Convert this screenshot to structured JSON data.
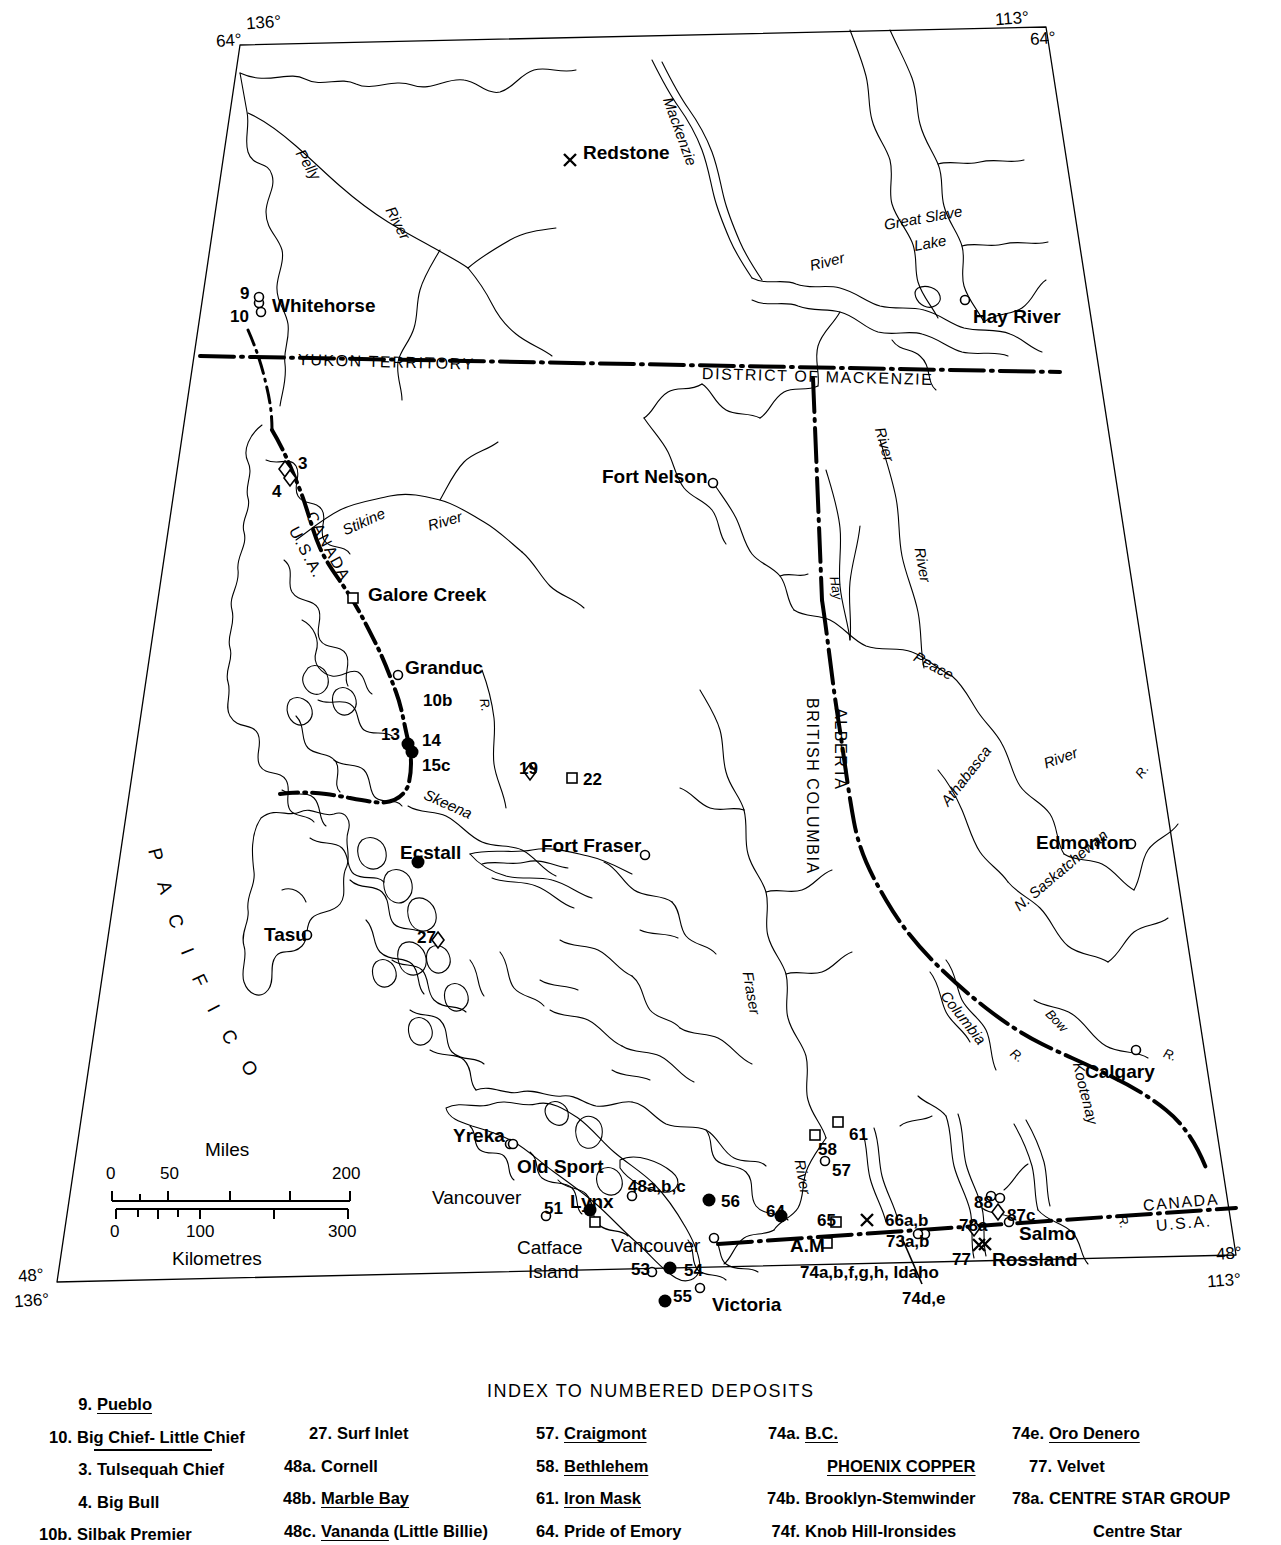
{
  "map": {
    "title": "Map of British Columbia and adjacent regions showing numbered mineral deposits",
    "corner_coords": [
      {
        "name": "top-left-lon",
        "text": "136°"
      },
      {
        "name": "top-left-lat",
        "text": "64°"
      },
      {
        "name": "top-right-lon",
        "text": "113°"
      },
      {
        "name": "top-right-lat",
        "text": "64°"
      },
      {
        "name": "bottom-left-lat",
        "text": "48°"
      },
      {
        "name": "bottom-left-lon",
        "text": "136°"
      },
      {
        "name": "bottom-right-lat",
        "text": "48°"
      },
      {
        "name": "bottom-right-lon",
        "text": "113°"
      }
    ],
    "places": [
      {
        "label": "Redstone",
        "x": 583,
        "y": 143,
        "marker": "x",
        "mx": 570,
        "my": 160
      },
      {
        "label": "Whitehorse",
        "x": 272,
        "y": 296,
        "marker": "circle",
        "mx": 259,
        "my": 303
      },
      {
        "label": "Hay River",
        "x": 973,
        "y": 307,
        "marker": "circle",
        "mx": 965,
        "my": 300
      },
      {
        "label": "Fort Nelson",
        "x": 602,
        "y": 467,
        "marker": "circle",
        "mx": 713,
        "my": 483
      },
      {
        "label": "Galore Creek",
        "x": 368,
        "y": 585,
        "marker": "square",
        "mx": 353,
        "my": 598
      },
      {
        "label": "Granduc",
        "x": 405,
        "y": 658,
        "marker": "circle",
        "mx": 398,
        "my": 675
      },
      {
        "label": "Ecstall",
        "x": 400,
        "y": 843,
        "marker": "dot",
        "mx": 418,
        "my": 862
      },
      {
        "label": "Fort Fraser",
        "x": 541,
        "y": 836,
        "marker": "circle",
        "mx": 645,
        "my": 855
      },
      {
        "label": "Tasu",
        "x": 264,
        "y": 925,
        "marker": "circle",
        "mx": 307,
        "my": 935
      },
      {
        "label": "Edmonton",
        "x": 1036,
        "y": 833,
        "marker": "circle",
        "mx": 1131,
        "my": 844
      },
      {
        "label": "Calgary",
        "x": 1085,
        "y": 1062,
        "marker": "circle",
        "mx": 1136,
        "my": 1050
      },
      {
        "label": "Yreka",
        "x": 453,
        "y": 1126,
        "marker": "circle",
        "mx": 510,
        "my": 1144
      },
      {
        "label": "Old Sport",
        "x": 517,
        "y": 1157,
        "marker": "circle",
        "mx": 513,
        "my": 1144
      },
      {
        "label": "Vancouver",
        "x": 432,
        "y": 1188,
        "marker": "none",
        "mx": 0,
        "my": 0
      },
      {
        "label": "Lynx",
        "x": 570,
        "y": 1192,
        "marker": "dot",
        "mx": 590,
        "my": 1210
      },
      {
        "label": "Catface",
        "x": 517,
        "y": 1238,
        "marker": "none",
        "mx": 0,
        "my": 0
      },
      {
        "label": "Island",
        "x": 528,
        "y": 1262,
        "marker": "none",
        "mx": 0,
        "my": 0
      },
      {
        "label": "Vancouver",
        "x": 611,
        "y": 1236,
        "marker": "circle",
        "mx": 714,
        "my": 1238
      },
      {
        "label": "Victoria",
        "x": 712,
        "y": 1295,
        "marker": "circle",
        "mx": 700,
        "my": 1288
      },
      {
        "label": "Salmo",
        "x": 1019,
        "y": 1224,
        "marker": "circle",
        "mx": 1009,
        "my": 1222
      },
      {
        "label": "Rossland",
        "x": 992,
        "y": 1250,
        "marker": "x",
        "mx": 985,
        "my": 1244
      },
      {
        "label": "A.M",
        "x": 790,
        "y": 1236,
        "marker": "square",
        "mx": 827,
        "my": 1243
      }
    ],
    "ocean_label": "P A C I F I C    O C E A N",
    "regions": [
      {
        "label": "YUKON TERRITORY",
        "x": 298,
        "y": 352
      },
      {
        "label": "DISTRICT OF MACKENZIE",
        "x": 702,
        "y": 366
      },
      {
        "label": "BRITISH COLUMBIA",
        "x": 812,
        "y": 690
      },
      {
        "label": "ALBERTA",
        "x": 840,
        "y": 700
      },
      {
        "label": "CANADA",
        "x": 310,
        "y": 505
      },
      {
        "label": "U.S.A.",
        "x": 293,
        "y": 520
      },
      {
        "label": "CANADA",
        "x": 1143,
        "y": 1198
      },
      {
        "label": "U.S.A.",
        "x": 1156,
        "y": 1218
      }
    ],
    "rivers": [
      {
        "label": "Pelly",
        "x": 300,
        "y": 143,
        "rot": 58
      },
      {
        "label": "River",
        "x": 390,
        "y": 200,
        "rot": 62
      },
      {
        "label": "Mackenzie",
        "x": 668,
        "y": 90,
        "rot": 70
      },
      {
        "label": "River",
        "x": 810,
        "y": 258,
        "rot": -14
      },
      {
        "label": "Great Slave",
        "x": 884,
        "y": 217,
        "rot": -10
      },
      {
        "label": "Lake",
        "x": 914,
        "y": 238,
        "rot": -10
      },
      {
        "label": "River",
        "x": 880,
        "y": 420,
        "rot": 74
      },
      {
        "label": "Hay",
        "x": 834,
        "y": 570,
        "rot": 80
      },
      {
        "label": "River",
        "x": 920,
        "y": 540,
        "rot": 80
      },
      {
        "label": "Peace",
        "x": 915,
        "y": 648,
        "rot": 28
      },
      {
        "label": "Stikine",
        "x": 343,
        "y": 523,
        "rot": -24
      },
      {
        "label": "River",
        "x": 428,
        "y": 518,
        "rot": -16
      },
      {
        "label": "R.",
        "x": 484,
        "y": 692,
        "rot": 80
      },
      {
        "label": "Skeena",
        "x": 425,
        "y": 786,
        "rot": 24
      },
      {
        "label": "Athabasca",
        "x": 944,
        "y": 796,
        "rot": -52
      },
      {
        "label": "River",
        "x": 1044,
        "y": 756,
        "rot": -20
      },
      {
        "label": "R.",
        "x": 1138,
        "y": 770,
        "rot": -54
      },
      {
        "label": "N. Saskatchewan",
        "x": 1016,
        "y": 900,
        "rot": -40
      },
      {
        "label": "Columbia",
        "x": 944,
        "y": 985,
        "rot": 52
      },
      {
        "label": "R.",
        "x": 1012,
        "y": 1045,
        "rot": 38
      },
      {
        "label": "Bow",
        "x": 1048,
        "y": 1005,
        "rot": 46
      },
      {
        "label": "R.",
        "x": 1164,
        "y": 1046,
        "rot": 20
      },
      {
        "label": "Fraser",
        "x": 748,
        "y": 964,
        "rot": 80
      },
      {
        "label": "River",
        "x": 800,
        "y": 1152,
        "rot": 80
      },
      {
        "label": "Kootenay",
        "x": 1078,
        "y": 1055,
        "rot": 76
      },
      {
        "label": "R.",
        "x": 1122,
        "y": 1209,
        "rot": 76
      }
    ],
    "deposit_numbers": [
      {
        "label": "9",
        "x": 240,
        "y": 285
      },
      {
        "label": "10",
        "x": 230,
        "y": 308
      },
      {
        "label": "3",
        "x": 298,
        "y": 455
      },
      {
        "label": "4",
        "x": 272,
        "y": 483
      },
      {
        "label": "10b",
        "x": 423,
        "y": 692
      },
      {
        "label": "13",
        "x": 381,
        "y": 726
      },
      {
        "label": "14",
        "x": 422,
        "y": 732
      },
      {
        "label": "15c",
        "x": 422,
        "y": 757
      },
      {
        "label": "19",
        "x": 519,
        "y": 760
      },
      {
        "label": "22",
        "x": 583,
        "y": 771
      },
      {
        "label": "27",
        "x": 417,
        "y": 929
      },
      {
        "label": "51",
        "x": 544,
        "y": 1200
      },
      {
        "label": "48a,b,c",
        "x": 628,
        "y": 1178
      },
      {
        "label": "56",
        "x": 721,
        "y": 1193
      },
      {
        "label": "64",
        "x": 766,
        "y": 1203
      },
      {
        "label": "65",
        "x": 817,
        "y": 1212
      },
      {
        "label": "66a,b",
        "x": 885,
        "y": 1212
      },
      {
        "label": "73a,b",
        "x": 886,
        "y": 1233
      },
      {
        "label": "53",
        "x": 631,
        "y": 1261
      },
      {
        "label": "54",
        "x": 684,
        "y": 1262
      },
      {
        "label": "55",
        "x": 673,
        "y": 1288
      },
      {
        "label": "58",
        "x": 818,
        "y": 1141
      },
      {
        "label": "61",
        "x": 849,
        "y": 1126
      },
      {
        "label": "57",
        "x": 832,
        "y": 1162
      },
      {
        "label": "88",
        "x": 974,
        "y": 1194
      },
      {
        "label": "87c",
        "x": 1007,
        "y": 1207
      },
      {
        "label": "78a",
        "x": 959,
        "y": 1217
      },
      {
        "label": "77",
        "x": 952,
        "y": 1251
      },
      {
        "label": "74a,b,f,g,h, Idaho",
        "x": 800,
        "y": 1264
      },
      {
        "label": "74d,e",
        "x": 902,
        "y": 1290
      }
    ],
    "scale": {
      "miles_label": "Miles",
      "km_label": "Kilometres",
      "miles_ticks": [
        "0",
        "50",
        "200"
      ],
      "km_ticks": [
        "0",
        "100",
        "300"
      ]
    }
  },
  "index": {
    "title": "INDEX TO NUMBERED DEPOSITS",
    "columns": [
      {
        "left": 30,
        "top": 1396,
        "numw": 42,
        "rows": [
          {
            "num": "9.",
            "name": "Pueblo",
            "underline": "full",
            "indent": 20
          },
          {
            "num": "10.",
            "name": "Big Chief- Little Chief",
            "underline": "mid",
            "indent": 0
          },
          {
            "num": "3.",
            "name": "Tulsequah Chief",
            "underline": "none",
            "indent": 20
          },
          {
            "num": "4.",
            "name": "Big Bull",
            "underline": "none",
            "indent": 20
          },
          {
            "num": "10b.",
            "name": "Silbak Premier",
            "underline": "none",
            "indent": 0
          }
        ]
      },
      {
        "left": 272,
        "top": 1425,
        "numw": 44,
        "rows": [
          {
            "num": "27.",
            "name": "Surf Inlet",
            "underline": "none",
            "indent": 16
          },
          {
            "num": "48a.",
            "name": "Cornell",
            "underline": "none",
            "indent": 0
          },
          {
            "num": "48b.",
            "name": "Marble Bay",
            "underline": "full",
            "indent": 0
          },
          {
            "num": "48c.",
            "name": "Vananda",
            "suffix": " (Little Billie)",
            "underline": "part",
            "indent": 0
          }
        ]
      },
      {
        "left": 523,
        "top": 1425,
        "numw": 36,
        "rows": [
          {
            "num": "57.",
            "name": "Craigmont",
            "underline": "full",
            "indent": 0
          },
          {
            "num": "58.",
            "name": "Bethlehem",
            "underline": "full",
            "indent": 0
          },
          {
            "num": "61.",
            "name": "Iron Mask",
            "underline": "full",
            "indent": 0
          },
          {
            "num": "64.",
            "name": "Pride of Emory",
            "underline": "none",
            "indent": 0
          }
        ]
      },
      {
        "left": 756,
        "top": 1425,
        "numw": 44,
        "rows": [
          {
            "num": "74a.",
            "name": "B.C.",
            "underline": "full",
            "indent": 0
          },
          {
            "num": "",
            "name": "PHOENIX COPPER",
            "underline": "full",
            "indent": 22
          },
          {
            "num": "74b.",
            "name": "Brooklyn-Stemwinder",
            "underline": "none",
            "indent": 0
          },
          {
            "num": "74f.",
            "name": "Knob Hill-Ironsides",
            "underline": "none",
            "indent": 0
          }
        ]
      },
      {
        "left": 1000,
        "top": 1425,
        "numw": 44,
        "rows": [
          {
            "num": "74e.",
            "name": "Oro Denero",
            "underline": "full",
            "indent": 0
          },
          {
            "num": "77.",
            "name": "Velvet",
            "underline": "none",
            "indent": 8
          },
          {
            "num": "78a.",
            "name": "CENTRE STAR GROUP",
            "underline": "none",
            "indent": 0
          },
          {
            "num": "",
            "name": "Centre Star",
            "underline": "none",
            "indent": 44
          }
        ]
      }
    ]
  }
}
